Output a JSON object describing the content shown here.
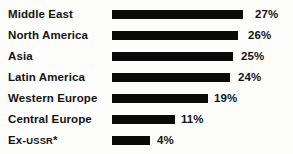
{
  "chart_data": {
    "type": "bar",
    "title": "",
    "subtitle": "",
    "xlabel": "",
    "ylabel": "",
    "orientation": "horizontal",
    "grid": false,
    "legend": null,
    "axis_visible": false,
    "value_suffix": "%",
    "xlim": [
      0,
      30
    ],
    "categories": [
      "Middle East",
      "North America",
      "Asia",
      "Latin America",
      "Western Europe",
      "Central Europe",
      "Ex-USSR*"
    ],
    "values": [
      27,
      26,
      25,
      24,
      19,
      11,
      4
    ],
    "value_labels": [
      "27%",
      "26%",
      "25%",
      "24%",
      "19%",
      "11%",
      "4%"
    ],
    "bar_pixel_widths": [
      131,
      126,
      121,
      118,
      96,
      63,
      38
    ],
    "footnote_marker": "*",
    "colors": {
      "bar": "#0a0a0a",
      "text": "#131313",
      "background": "#fdfdfc"
    }
  },
  "rows": [
    {
      "label": "Middle East",
      "label_main": "Middle East",
      "label_caps": "",
      "label_tail": "",
      "value_label": "27%",
      "top": 4,
      "bar_width": 131,
      "value_x": 255
    },
    {
      "label": "North America",
      "label_main": "North America",
      "label_caps": "",
      "label_tail": "",
      "value_label": "26%",
      "top": 25,
      "bar_width": 126,
      "value_x": 248
    },
    {
      "label": "Asia",
      "label_main": "Asia",
      "label_caps": "",
      "label_tail": "",
      "value_label": "25%",
      "top": 46,
      "bar_width": 121,
      "value_x": 241
    },
    {
      "label": "Latin America",
      "label_main": "Latin America",
      "label_caps": "",
      "label_tail": "",
      "value_label": "24%",
      "top": 67,
      "bar_width": 118,
      "value_x": 238
    },
    {
      "label": "Western Europe",
      "label_main": "Western Europe",
      "label_caps": "",
      "label_tail": "",
      "value_label": "19%",
      "top": 88,
      "bar_width": 96,
      "value_x": 214
    },
    {
      "label": "Central Europe",
      "label_main": "Central Europe",
      "label_caps": "",
      "label_tail": "",
      "value_label": "11%",
      "top": 109,
      "bar_width": 63,
      "value_x": 181
    },
    {
      "label": "Ex-USSR*",
      "label_main": "Ex-",
      "label_caps": "USSR",
      "label_tail": "*",
      "value_label": "4%",
      "top": 130,
      "bar_width": 38,
      "value_x": 157
    }
  ]
}
